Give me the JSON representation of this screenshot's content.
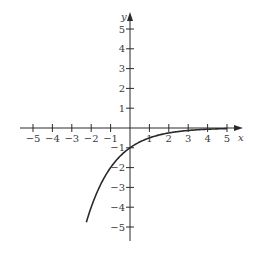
{
  "chart_data": {
    "type": "line",
    "title": "",
    "xlabel": "x",
    "ylabel": "y",
    "xlim": [
      -5,
      5
    ],
    "ylim": [
      -5,
      5
    ],
    "grid": false,
    "x_ticks": [
      -5,
      -4,
      -3,
      -2,
      -1,
      1,
      2,
      3,
      4,
      5
    ],
    "x_tick_labels": [
      "−5",
      "−4",
      "−3",
      "−2",
      "−1",
      "1",
      "2",
      "3",
      "4",
      "5"
    ],
    "y_ticks": [
      5,
      4,
      3,
      2,
      1,
      -1,
      -2,
      -3,
      -4,
      -5
    ],
    "y_tick_labels": [
      "5",
      "4",
      "3",
      "2",
      "1",
      "−1",
      "−2",
      "−3",
      "−4",
      "−5"
    ],
    "series": [
      {
        "name": "y = -2^(-x)",
        "function": "-2^(-x)",
        "x_range": [
          -2.25,
          5
        ],
        "x": [
          -2.25,
          -2,
          -1.5,
          -1,
          -0.5,
          0,
          0.5,
          1,
          1.5,
          2,
          3,
          4,
          5
        ],
        "y": [
          -4.76,
          -4,
          -2.83,
          -2,
          -1.41,
          -1,
          -0.71,
          -0.5,
          -0.35,
          -0.25,
          -0.125,
          -0.0625,
          -0.03
        ]
      }
    ]
  }
}
